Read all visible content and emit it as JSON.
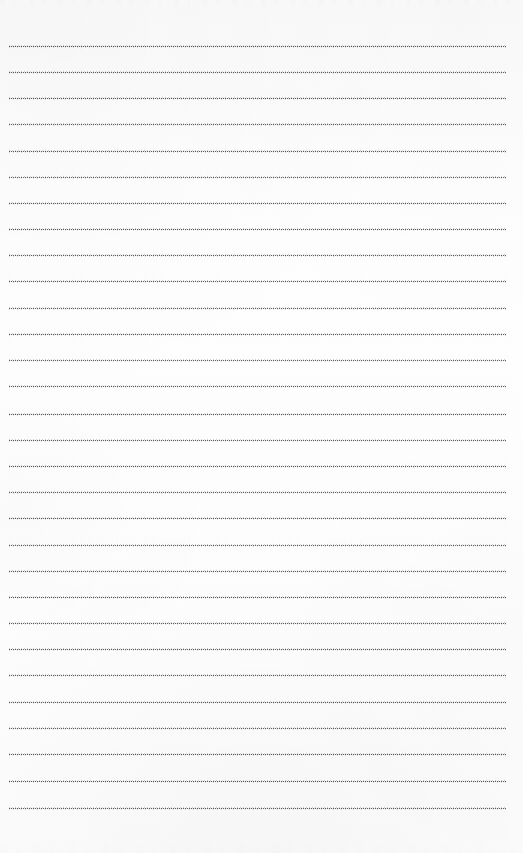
{
  "document": {
    "kind": "scanned-lined-notebook-page",
    "title": "",
    "body_text": "",
    "handwriting": "",
    "page_number": "",
    "header_text": "",
    "footer_text": ""
  },
  "page": {
    "width": 523,
    "height": 853,
    "background_color": "#fdfdfd",
    "paper_tint": "#fcfcfc"
  },
  "ruling": {
    "style": "dotted",
    "line_color": "#2a2a30",
    "line_count": 30,
    "first_line_y": 46,
    "line_spacing": 26.1,
    "line_left_x": 9,
    "line_right_x": 506,
    "line_thickness": 1,
    "dot_period": 2,
    "lines_y": [
      46,
      72,
      98,
      124,
      151,
      177,
      203,
      229,
      255,
      281,
      308,
      334,
      360,
      386,
      414,
      440,
      466,
      492,
      518,
      545,
      571,
      597,
      623,
      649,
      675,
      702,
      728,
      754,
      781,
      808
    ],
    "lines_label": [
      "rule-line-1",
      "rule-line-2",
      "rule-line-3",
      "rule-line-4",
      "rule-line-5",
      "rule-line-6",
      "rule-line-7",
      "rule-line-8",
      "rule-line-9",
      "rule-line-10",
      "rule-line-11",
      "rule-line-12",
      "rule-line-13",
      "rule-line-14",
      "rule-line-15",
      "rule-line-16",
      "rule-line-17",
      "rule-line-18",
      "rule-line-19",
      "rule-line-20",
      "rule-line-21",
      "rule-line-22",
      "rule-line-23",
      "rule-line-24",
      "rule-line-25",
      "rule-line-26",
      "rule-line-27",
      "rule-line-28",
      "rule-line-29",
      "rule-line-30"
    ]
  },
  "margins": {
    "top_blank_height": 46,
    "bottom_blank_height": 45,
    "left_blank_width": 9,
    "right_blank_width": 17
  },
  "artifacts": {
    "top_edge_smudge": true,
    "bottom_edge_smudge": true,
    "scan_grain": true
  }
}
